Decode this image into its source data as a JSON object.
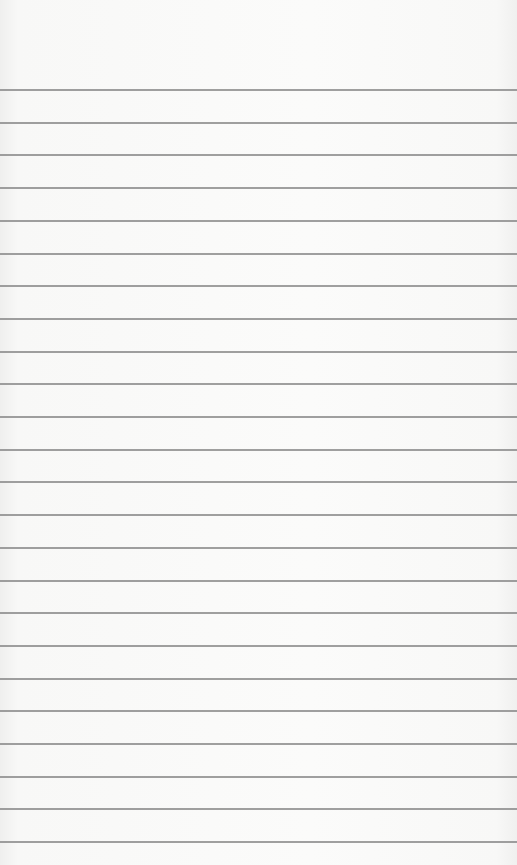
{
  "paper": {
    "type": "lined-notepad",
    "background_color": "#f7f7f6",
    "line_color": "#8e8e8e",
    "first_line_y": 89,
    "line_spacing": 32.7,
    "line_count": 24
  }
}
